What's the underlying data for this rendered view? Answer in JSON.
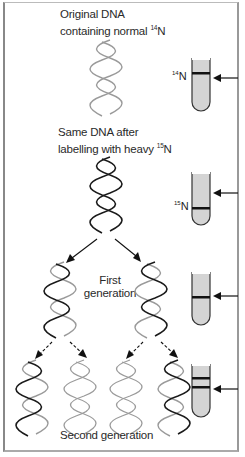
{
  "stages": [
    {
      "id": "original",
      "caption_line1": "Original DNA",
      "caption_line2_prefix": "containing normal ",
      "caption_isotope_mass": "14",
      "caption_isotope_symbol": "N",
      "tube_label_mass": "14",
      "tube_label_symbol": "N",
      "bands": [
        "light"
      ]
    },
    {
      "id": "labelled",
      "caption_line1": "Same DNA after",
      "caption_line2_prefix": "labelling with heavy ",
      "caption_isotope_mass": "15",
      "caption_isotope_symbol": "N",
      "tube_label_mass": "15",
      "tube_label_symbol": "N",
      "bands": [
        "heavy"
      ]
    },
    {
      "id": "first-generation",
      "caption_line1": "First",
      "caption_line2": "generation",
      "bands": [
        "hybrid"
      ]
    },
    {
      "id": "second-generation",
      "caption": "Second generation",
      "bands": [
        "light",
        "hybrid"
      ]
    }
  ],
  "colors": {
    "heavy_strand": "#1a1a1a",
    "light_strand": "#9a9a9a",
    "tube_fill": "#d4d4d4",
    "band": "#111111",
    "border": "#999999"
  }
}
